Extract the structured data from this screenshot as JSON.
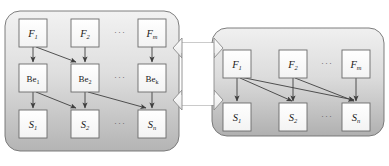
{
  "figure": {
    "type": "diagram",
    "title_fragment": "",
    "background": "#ffffff",
    "panel_fill_top": "#efefef",
    "panel_fill_bottom": "#b9b9b9",
    "panel_stroke": "#6e6e6e",
    "node_fill": "#fdfdfd",
    "node_stroke": "#6a6a6a",
    "arrow_color": "#4a4a4a",
    "connector_fill": "#fbfbfb",
    "connector_stroke": "#8a8a8a"
  },
  "left_panel": {
    "name": "left-model-panel",
    "rows": [
      {
        "row_name": "factor-row",
        "nodes": [
          {
            "id": "L-F1",
            "base": "F",
            "sub": "1"
          },
          {
            "id": "L-F2",
            "base": "F",
            "sub": "2"
          },
          {
            "id": "L-ellipsis-1",
            "base": "···",
            "sub": ""
          },
          {
            "id": "L-Fm",
            "base": "F",
            "sub": "m"
          }
        ]
      },
      {
        "row_name": "behaviour-row",
        "nodes": [
          {
            "id": "L-Be1",
            "base": "Be",
            "sub": "1"
          },
          {
            "id": "L-Be2",
            "base": "Be",
            "sub": "2"
          },
          {
            "id": "L-ellipsis-2",
            "base": "···",
            "sub": ""
          },
          {
            "id": "L-Bek",
            "base": "Be",
            "sub": "k"
          }
        ]
      },
      {
        "row_name": "state-row",
        "nodes": [
          {
            "id": "L-S1",
            "base": "S",
            "sub": "1"
          },
          {
            "id": "L-S2",
            "base": "S",
            "sub": "2"
          },
          {
            "id": "L-ellipsis-3",
            "base": "···",
            "sub": ""
          },
          {
            "id": "L-Sn",
            "base": "S",
            "sub": "n"
          }
        ]
      }
    ]
  },
  "right_panel": {
    "name": "right-model-panel",
    "rows": [
      {
        "row_name": "factor-row",
        "nodes": [
          {
            "id": "R-F1",
            "base": "F",
            "sub": "1"
          },
          {
            "id": "R-F2",
            "base": "F",
            "sub": "2"
          },
          {
            "id": "R-ellipsis-1",
            "base": "···",
            "sub": ""
          },
          {
            "id": "R-Fm",
            "base": "F",
            "sub": "m"
          }
        ]
      },
      {
        "row_name": "state-row",
        "nodes": [
          {
            "id": "R-S1",
            "base": "S",
            "sub": "1"
          },
          {
            "id": "R-S2",
            "base": "S",
            "sub": "2"
          },
          {
            "id": "R-ellipsis-2",
            "base": "···",
            "sub": ""
          },
          {
            "id": "R-Sn",
            "base": "S",
            "sub": "n"
          }
        ]
      }
    ]
  },
  "connectors": [
    {
      "id": "conn-upper",
      "kind": "double-headed-block-arrow"
    },
    {
      "id": "conn-lower",
      "kind": "double-headed-block-arrow"
    }
  ],
  "labels": {
    "L-F1": "F",
    "L-F1s": "1",
    "L-F2": "F",
    "L-F2s": "2",
    "L-Fm": "F",
    "L-Fms": "m",
    "L-Be1": "Be",
    "L-Be1s": "1",
    "L-Be2": "Be",
    "L-Be2s": "2",
    "L-Bek": "Be",
    "L-Beks": "k",
    "L-S1": "S",
    "L-S1s": "1",
    "L-S2": "S",
    "L-S2s": "2",
    "L-Sn": "S",
    "L-Sns": "n",
    "R-F1": "F",
    "R-F1s": "1",
    "R-F2": "F",
    "R-F2s": "2",
    "R-Fm": "F",
    "R-Fms": "m",
    "R-S1": "S",
    "R-S1s": "1",
    "R-S2": "S",
    "R-S2s": "2",
    "R-Sn": "S",
    "R-Sns": "n",
    "dots": "···"
  },
  "top_text": {
    "fragment": "· · ·   · · ·    · · ·    · · ·            · · ·    · · ·    · · ·"
  }
}
